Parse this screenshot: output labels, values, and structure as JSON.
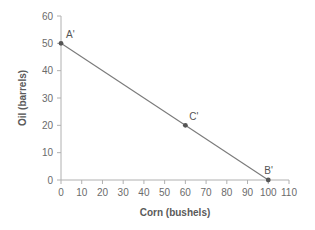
{
  "chart_data": {
    "type": "line",
    "title": "",
    "xlabel": "Corn (bushels)",
    "ylabel": "Oil (barrels)",
    "xlim": [
      0,
      110
    ],
    "ylim": [
      0,
      60
    ],
    "x_ticks": [
      0,
      10,
      20,
      30,
      40,
      50,
      60,
      70,
      80,
      90,
      100,
      110
    ],
    "y_ticks": [
      0,
      10,
      20,
      30,
      40,
      50,
      60
    ],
    "grid": false,
    "series": [
      {
        "name": "Production possibilities frontier",
        "x": [
          0,
          100
        ],
        "y": [
          50,
          0
        ],
        "color": "#7a7a7a"
      }
    ],
    "points": [
      {
        "label": "A'",
        "x": 0,
        "y": 50
      },
      {
        "label": "C'",
        "x": 60,
        "y": 20
      },
      {
        "label": "B'",
        "x": 100,
        "y": 0
      }
    ]
  },
  "colors": {
    "axis": "#b0b0b0",
    "line": "#7a7a7a",
    "point": "#555555",
    "text": "#6b6b6b"
  }
}
